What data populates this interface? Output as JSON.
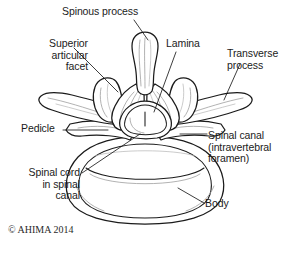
{
  "figure": {
    "background_color": "#ffffff",
    "ink_color": "#1b1b1b",
    "shading_color": "#9a9a9a",
    "copyright": "© AHIMA 2014"
  },
  "labels": {
    "spinous_process": "Spinous process",
    "superior_articular_facet": "Superior\narticular\nfacet",
    "lamina": "Lamina",
    "transverse_process": "Transverse\nprocess",
    "pedicle": "Pedicle",
    "spinal_canal": "Spinal canal\n(intravertebral\nforamen)",
    "spinal_cord": "Spinal cord\nin spinal\ncanal",
    "body": "Body"
  },
  "anatomy_parts": [
    {
      "name": "spinous-process",
      "label": "Spinous process",
      "position": "top-center"
    },
    {
      "name": "superior-articular-facet",
      "label": "Superior articular facet",
      "position": "upper-left"
    },
    {
      "name": "lamina",
      "label": "Lamina",
      "position": "upper-right-center"
    },
    {
      "name": "transverse-process",
      "label": "Transverse process",
      "position": "right-wing"
    },
    {
      "name": "pedicle",
      "label": "Pedicle",
      "position": "mid-left"
    },
    {
      "name": "spinal-canal",
      "label": "Spinal canal (intravertebral foramen)",
      "position": "center"
    },
    {
      "name": "spinal-cord",
      "label": "Spinal cord in spinal canal",
      "position": "center"
    },
    {
      "name": "vertebral-body",
      "label": "Body",
      "position": "bottom-center"
    }
  ]
}
